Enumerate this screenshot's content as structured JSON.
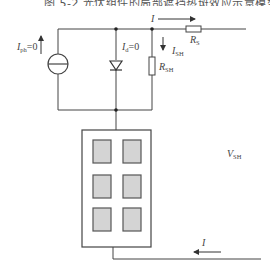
{
  "figure": {
    "caption": "图 5-2  光伏组件的局部遮挡热斑效应示意模型",
    "caption_cropped": true
  },
  "labels": {
    "photocurrent": {
      "main": "I",
      "sub": "ph",
      "suffix": "=0"
    },
    "diode_current": {
      "main": "I",
      "sub": "d",
      "suffix": "=0"
    },
    "top_current": {
      "main": "I"
    },
    "shunt_current": {
      "main": "I",
      "sub": "SH"
    },
    "series_resistor": {
      "main": "R",
      "sub": "S"
    },
    "shunt_resistor": {
      "main": "R",
      "sub": "SH"
    },
    "shunt_voltage": {
      "main": "V",
      "sub": "SH"
    },
    "bottom_current": {
      "main": "I"
    }
  },
  "components": {
    "current_source": "current-source",
    "diode": "diode",
    "series_resistor": "resistor",
    "shunt_resistor": "resistor",
    "pv_module": {
      "rows": 3,
      "cols": 2,
      "cell_fill": "#d4d4d4",
      "cell_stroke": "#555555"
    }
  },
  "colors": {
    "wire": "#444444",
    "background": "#ffffff"
  }
}
